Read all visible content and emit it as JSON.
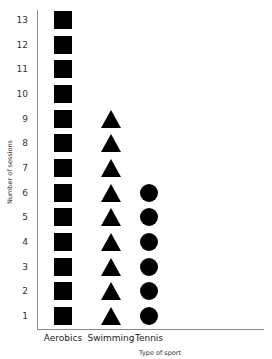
{
  "chart_data": {
    "type": "pictograph",
    "title": "",
    "xlabel": "Type of sport",
    "ylabel": "Number of sessions",
    "categories": [
      "Aerobics",
      "Swimming",
      "Tennis"
    ],
    "values": [
      13,
      9,
      6
    ],
    "markers": [
      "square",
      "triangle",
      "circle"
    ],
    "yticks": [
      1,
      2,
      3,
      4,
      5,
      6,
      7,
      8,
      9,
      10,
      11,
      12,
      13
    ],
    "ylim": [
      0,
      13
    ],
    "grid": false,
    "legend": "none"
  }
}
